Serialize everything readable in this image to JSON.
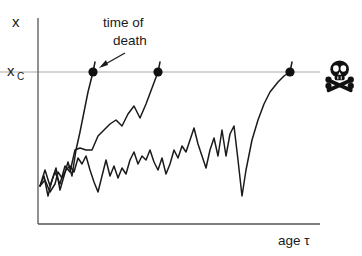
{
  "figure": {
    "background_color": "#ffffff",
    "ink_color": "#1a1a1a",
    "axis_color": "#555555",
    "threshold_line_color": "#aaaaaa"
  },
  "labels": {
    "y_axis": "x",
    "threshold_base": "x",
    "threshold_sub": "C",
    "x_axis": "age τ",
    "annotation_line1": "time of",
    "annotation_line2": "death"
  },
  "icons": {
    "skull_and_crossbones": "skull-crossbones-icon",
    "arrow": "annotation-arrow-icon",
    "death_marker": "death-dot-marker"
  },
  "chart_data": {
    "type": "line",
    "title": "",
    "xlabel": "age τ",
    "ylabel": "x",
    "grid": false,
    "legend": null,
    "axis_pixel_box": {
      "x0": 38,
      "y0": 18,
      "x1": 320,
      "y1": 224
    },
    "xlim": [
      0,
      100
    ],
    "ylim": [
      0,
      100
    ],
    "threshold": {
      "name": "x_C",
      "label": "x_C",
      "value": 75,
      "pixel_y": 72,
      "line_from_x": 0,
      "line_to_x": 115
    },
    "annotation": {
      "text": "time of death",
      "points_to_series": "trajectory-1",
      "points_to_pixel": [
        97,
        70
      ],
      "text_pixel": [
        103,
        22
      ]
    },
    "death_markers": [
      {
        "series": "trajectory-1",
        "x": 19.5,
        "y": 75,
        "pixel": [
          93,
          72
        ]
      },
      {
        "series": "trajectory-2",
        "x": 42.5,
        "y": 75,
        "pixel": [
          158,
          72
        ]
      },
      {
        "series": "trajectory-3",
        "x": 89.4,
        "y": 75,
        "pixel": [
          290,
          72
        ]
      }
    ],
    "skull_marker": {
      "pixel": [
        340,
        76
      ],
      "meaning": "death"
    },
    "series": [
      {
        "name": "trajectory-1",
        "description": "fast riser, crosses threshold first",
        "points_pixel": [
          [
            40,
            186
          ],
          [
            44,
            176
          ],
          [
            48,
            196
          ],
          [
            52,
            180
          ],
          [
            56,
            168
          ],
          [
            60,
            190
          ],
          [
            64,
            176
          ],
          [
            68,
            162
          ],
          [
            72,
            176
          ],
          [
            76,
            150
          ],
          [
            80,
            132
          ],
          [
            84,
            112
          ],
          [
            88,
            92
          ],
          [
            93,
            72
          ],
          [
            95,
            62
          ]
        ]
      },
      {
        "name": "trajectory-2",
        "description": "intermediate riser, crosses threshold second",
        "points_pixel": [
          [
            40,
            186
          ],
          [
            45,
            170
          ],
          [
            50,
            186
          ],
          [
            55,
            172
          ],
          [
            60,
            184
          ],
          [
            65,
            166
          ],
          [
            70,
            172
          ],
          [
            75,
            150
          ],
          [
            80,
            148
          ],
          [
            86,
            150
          ],
          [
            92,
            150
          ],
          [
            98,
            136
          ],
          [
            104,
            130
          ],
          [
            110,
            124
          ],
          [
            116,
            120
          ],
          [
            122,
            126
          ],
          [
            128,
            114
          ],
          [
            134,
            106
          ],
          [
            140,
            118
          ],
          [
            146,
            104
          ],
          [
            152,
            88
          ],
          [
            158,
            72
          ],
          [
            160,
            62
          ]
        ]
      },
      {
        "name": "trajectory-3",
        "description": "long survivor, fluctuates then rises steeply to threshold",
        "points_pixel": [
          [
            40,
            186
          ],
          [
            45,
            180
          ],
          [
            50,
            192
          ],
          [
            55,
            184
          ],
          [
            58,
            172
          ],
          [
            62,
            178
          ],
          [
            66,
            170
          ],
          [
            70,
            166
          ],
          [
            74,
            172
          ],
          [
            78,
            158
          ],
          [
            82,
            164
          ],
          [
            86,
            156
          ],
          [
            90,
            170
          ],
          [
            94,
            182
          ],
          [
            98,
            192
          ],
          [
            102,
            176
          ],
          [
            106,
            160
          ],
          [
            110,
            176
          ],
          [
            114,
            166
          ],
          [
            118,
            178
          ],
          [
            122,
            168
          ],
          [
            126,
            174
          ],
          [
            130,
            160
          ],
          [
            134,
            152
          ],
          [
            138,
            164
          ],
          [
            142,
            156
          ],
          [
            146,
            160
          ],
          [
            150,
            150
          ],
          [
            154,
            162
          ],
          [
            158,
            170
          ],
          [
            162,
            158
          ],
          [
            166,
            174
          ],
          [
            170,
            164
          ],
          [
            174,
            150
          ],
          [
            178,
            158
          ],
          [
            182,
            146
          ],
          [
            186,
            152
          ],
          [
            190,
            140
          ],
          [
            194,
            128
          ],
          [
            198,
            144
          ],
          [
            202,
            156
          ],
          [
            206,
            168
          ],
          [
            210,
            150
          ],
          [
            214,
            138
          ],
          [
            218,
            156
          ],
          [
            222,
            130
          ],
          [
            226,
            156
          ],
          [
            230,
            134
          ],
          [
            234,
            126
          ],
          [
            238,
            160
          ],
          [
            242,
            196
          ],
          [
            246,
            170
          ],
          [
            252,
            140
          ],
          [
            258,
            120
          ],
          [
            264,
            104
          ],
          [
            270,
            92
          ],
          [
            278,
            82
          ],
          [
            284,
            76
          ],
          [
            290,
            72
          ],
          [
            292,
            62
          ]
        ]
      }
    ]
  }
}
